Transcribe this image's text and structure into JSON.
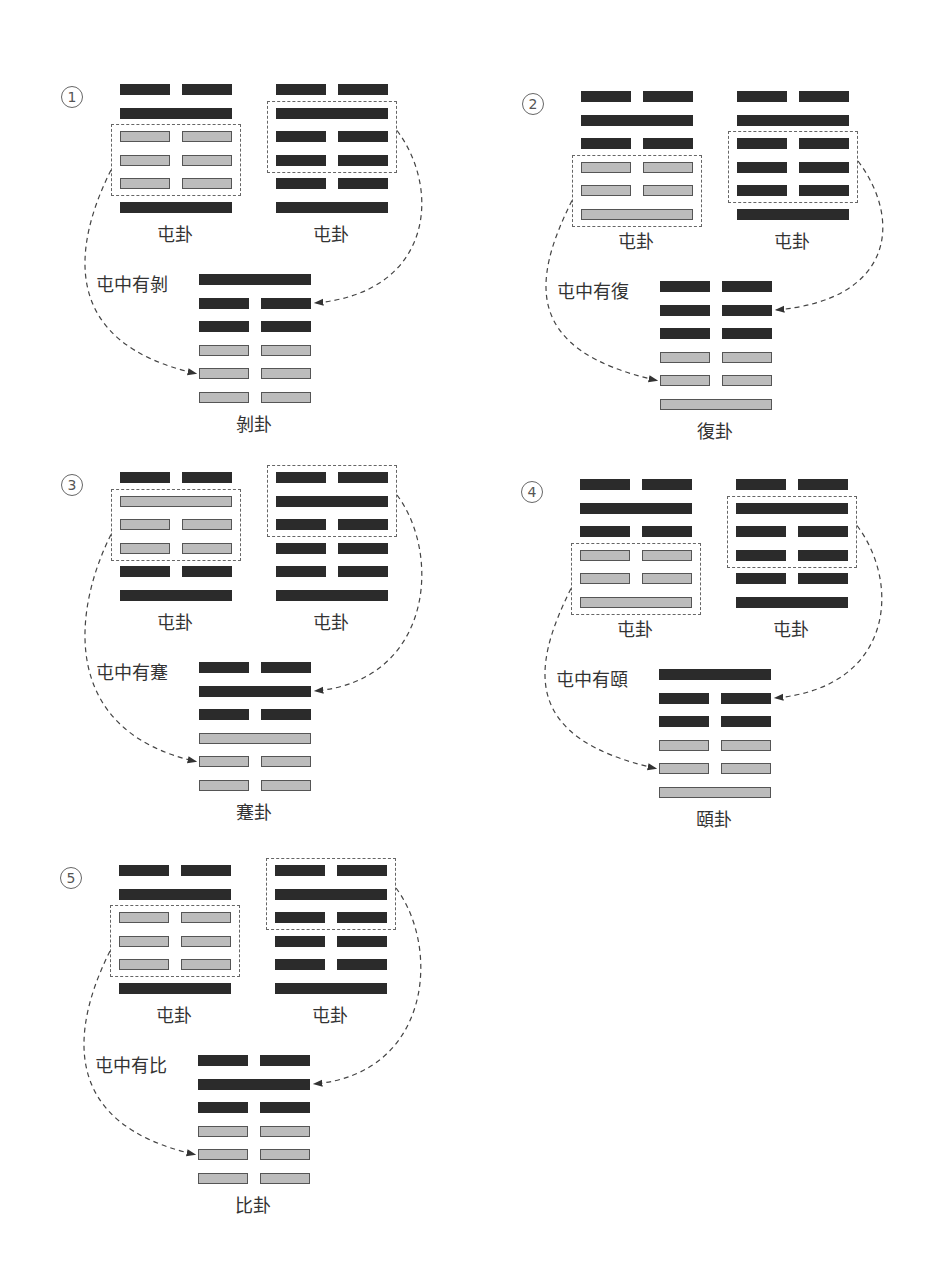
{
  "colors": {
    "yang_dark": "#2b2b2b",
    "yin_gray": "#bcbcbc",
    "dash": "#666666"
  },
  "legend_note": "line order listed top-to-bottom; 1 = solid (yang), 0 = broken (yin)",
  "panels": [
    {
      "number": "1",
      "source_left": {
        "name": "屯卦",
        "lines": [
          0,
          1,
          0,
          0,
          0,
          1
        ],
        "boxed": [
          2,
          4
        ],
        "gray": [
          2,
          3,
          4
        ]
      },
      "source_right": {
        "name": "屯卦",
        "lines": [
          0,
          1,
          0,
          0,
          0,
          1
        ],
        "boxed": [
          1,
          3
        ],
        "gray": []
      },
      "caption": "屯中有剝",
      "result": {
        "name": "剝卦",
        "lines": [
          1,
          0,
          0,
          0,
          0,
          0
        ],
        "gray": [
          3,
          4,
          5
        ]
      },
      "origin": [
        52,
        70
      ]
    },
    {
      "number": "2",
      "source_left": {
        "name": "屯卦",
        "lines": [
          0,
          1,
          0,
          0,
          0,
          1
        ],
        "boxed": [
          3,
          5
        ],
        "gray": [
          3,
          4,
          5
        ]
      },
      "source_right": {
        "name": "屯卦",
        "lines": [
          0,
          1,
          0,
          0,
          0,
          1
        ],
        "boxed": [
          2,
          4
        ],
        "gray": []
      },
      "caption": "屯中有復",
      "result": {
        "name": "復卦",
        "lines": [
          0,
          0,
          0,
          0,
          0,
          1
        ],
        "gray": [
          3,
          4,
          5
        ]
      },
      "origin": [
        513,
        77
      ]
    },
    {
      "number": "3",
      "source_left": {
        "name": "屯卦",
        "lines": [
          0,
          1,
          0,
          0,
          0,
          1
        ],
        "boxed": [
          1,
          3
        ],
        "gray": [
          1,
          2,
          3
        ]
      },
      "source_right": {
        "name": "屯卦",
        "lines": [
          0,
          1,
          0,
          0,
          0,
          1
        ],
        "boxed": [
          0,
          2
        ],
        "gray": []
      },
      "caption": "屯中有蹇",
      "result": {
        "name": "蹇卦",
        "lines": [
          0,
          1,
          0,
          1,
          0,
          0
        ],
        "gray": [
          3,
          4,
          5
        ]
      },
      "origin": [
        52,
        458
      ]
    },
    {
      "number": "4",
      "source_left": {
        "name": "屯卦",
        "lines": [
          0,
          1,
          0,
          0,
          0,
          1
        ],
        "boxed": [
          3,
          5
        ],
        "gray": [
          3,
          4,
          5
        ]
      },
      "source_right": {
        "name": "屯卦",
        "lines": [
          0,
          1,
          0,
          0,
          0,
          1
        ],
        "boxed": [
          1,
          3
        ],
        "gray": []
      },
      "caption": "屯中有頤",
      "result": {
        "name": "頤卦",
        "lines": [
          1,
          0,
          0,
          0,
          0,
          1
        ],
        "gray": [
          3,
          4,
          5
        ]
      },
      "origin": [
        512,
        465
      ]
    },
    {
      "number": "5",
      "source_left": {
        "name": "屯卦",
        "lines": [
          0,
          1,
          0,
          0,
          0,
          1
        ],
        "boxed": [
          2,
          4
        ],
        "gray": [
          2,
          3,
          4
        ]
      },
      "source_right": {
        "name": "屯卦",
        "lines": [
          0,
          1,
          0,
          0,
          0,
          1
        ],
        "boxed": [
          0,
          2
        ],
        "gray": []
      },
      "caption": "屯中有比",
      "result": {
        "name": "比卦",
        "lines": [
          0,
          1,
          0,
          0,
          0,
          0
        ],
        "gray": [
          3,
          4,
          5
        ]
      },
      "origin": [
        51,
        851
      ]
    }
  ]
}
